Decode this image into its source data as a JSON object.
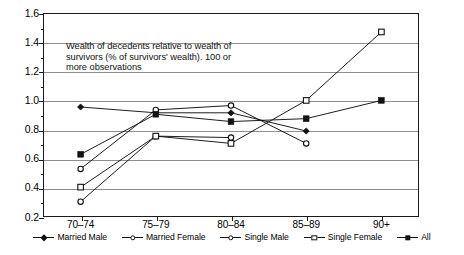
{
  "chart_data": {
    "type": "line",
    "title": "",
    "subtitle": "",
    "annotation": [
      "Wealth of decedents relative to wealth of",
      "survivors (% of survivors' wealth). 100 or",
      "more observations"
    ],
    "categories": [
      "70–74",
      "75–79",
      "80–84",
      "85–89",
      "90+"
    ],
    "xlabel": "",
    "ylabel": "",
    "ylim": [
      0.2,
      1.6
    ],
    "ytick_labels": [
      "0.2",
      "0.4",
      "0.6",
      "0.8",
      "1.0",
      "1.2",
      "1.4",
      "1.6"
    ],
    "ytick_values": [
      0.2,
      0.4,
      0.6,
      0.8,
      1.0,
      1.2,
      1.4,
      1.6
    ],
    "yminor_values": [
      0.3,
      0.5,
      0.7,
      0.9,
      1.1,
      1.3,
      1.5
    ],
    "grid": true,
    "legend_position": "bottom",
    "series": [
      {
        "name": "Married Male",
        "marker": "diamond-filled",
        "values": [
          0.955,
          0.915,
          0.915,
          0.79,
          null
        ]
      },
      {
        "name": "Married Female",
        "marker": "circle-open",
        "values": [
          0.53,
          0.935,
          0.965,
          0.705,
          null
        ]
      },
      {
        "name": "Single Male",
        "marker": "circle-open",
        "values": [
          0.305,
          0.755,
          0.745,
          null,
          null
        ]
      },
      {
        "name": "Single Female",
        "marker": "square-open",
        "values": [
          0.405,
          0.755,
          0.705,
          1.0,
          1.47
        ]
      },
      {
        "name": "All",
        "marker": "square-filled",
        "values": [
          0.63,
          0.905,
          0.855,
          0.875,
          1.0
        ]
      }
    ]
  },
  "legend": {
    "items": [
      {
        "label": "Married Male",
        "marker": "diamond-filled"
      },
      {
        "label": "Married Female",
        "marker": "circle-open"
      },
      {
        "label": "Single Male",
        "marker": "circle-open"
      },
      {
        "label": "Single Female",
        "marker": "square-open"
      },
      {
        "label": "All",
        "marker": "square-filled"
      }
    ]
  },
  "colors": {
    "line": "#111111",
    "grid": "#8e8e8e",
    "frame": "#1a1a1a",
    "background": "#ffffff"
  }
}
